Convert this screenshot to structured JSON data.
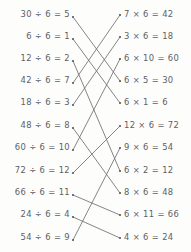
{
  "worksheet": {
    "type": "matching-worksheet",
    "topic": "division and multiplication facts of 6",
    "background_color": "#fdfdfc",
    "ink_color": "#4a4a4e",
    "line_color": "#6f6f73"
  },
  "left_column": {
    "name": "division-facts",
    "items": [
      {
        "id": "L1",
        "text": "30 ÷ 6 = 5",
        "dividend": 30,
        "divisor": 6,
        "quotient": 5,
        "y": 14
      },
      {
        "id": "L2",
        "text": "6 ÷ 6 = 1",
        "dividend": 6,
        "divisor": 6,
        "quotient": 1,
        "y": 36
      },
      {
        "id": "L3",
        "text": "12 ÷ 6 = 2",
        "dividend": 12,
        "divisor": 6,
        "quotient": 2,
        "y": 58
      },
      {
        "id": "L4",
        "text": "42 ÷ 6 = 7",
        "dividend": 42,
        "divisor": 6,
        "quotient": 7,
        "y": 80
      },
      {
        "id": "L5",
        "text": "18 ÷ 6 = 3",
        "dividend": 18,
        "divisor": 6,
        "quotient": 3,
        "y": 102
      },
      {
        "id": "L6",
        "text": "48 ÷ 6 = 8",
        "dividend": 48,
        "divisor": 6,
        "quotient": 8,
        "y": 125
      },
      {
        "id": "L7",
        "text": "60 ÷ 6 = 10",
        "dividend": 60,
        "divisor": 6,
        "quotient": 10,
        "y": 147
      },
      {
        "id": "L8",
        "text": "72 ÷ 6 = 12",
        "dividend": 72,
        "divisor": 6,
        "quotient": 12,
        "y": 170
      },
      {
        "id": "L9",
        "text": "66 ÷ 6 = 11",
        "dividend": 66,
        "divisor": 6,
        "quotient": 11,
        "y": 192
      },
      {
        "id": "L10",
        "text": "24 ÷ 6 = 4",
        "dividend": 24,
        "divisor": 6,
        "quotient": 4,
        "y": 214
      },
      {
        "id": "L11",
        "text": "54 ÷ 6 = 9",
        "dividend": 54,
        "divisor": 6,
        "quotient": 9,
        "y": 237
      }
    ]
  },
  "right_column": {
    "name": "multiplication-facts",
    "items": [
      {
        "id": "R1",
        "text": "7 × 6 = 42",
        "factor_a": 7,
        "factor_b": 6,
        "product": 42,
        "y": 14
      },
      {
        "id": "R2",
        "text": "3 × 6 = 18",
        "factor_a": 3,
        "factor_b": 6,
        "product": 18,
        "y": 36
      },
      {
        "id": "R3",
        "text": "6 × 10 = 60",
        "factor_a": 6,
        "factor_b": 10,
        "product": 60,
        "y": 58
      },
      {
        "id": "R4",
        "text": "6 × 5 = 30",
        "factor_a": 6,
        "factor_b": 5,
        "product": 30,
        "y": 80
      },
      {
        "id": "R5",
        "text": "6 × 1 = 6",
        "factor_a": 6,
        "factor_b": 1,
        "product": 6,
        "y": 102
      },
      {
        "id": "R6",
        "text": "12 × 6 = 72",
        "factor_a": 12,
        "factor_b": 6,
        "product": 72,
        "y": 125
      },
      {
        "id": "R7",
        "text": "9 × 6 = 54",
        "factor_a": 9,
        "factor_b": 6,
        "product": 54,
        "y": 147
      },
      {
        "id": "R8",
        "text": "6 × 2 = 12",
        "factor_a": 6,
        "factor_b": 2,
        "product": 12,
        "y": 170
      },
      {
        "id": "R9",
        "text": "8 × 6 = 48",
        "factor_a": 8,
        "factor_b": 6,
        "product": 48,
        "y": 192
      },
      {
        "id": "R10",
        "text": "6 × 11 = 66",
        "factor_a": 6,
        "factor_b": 11,
        "product": 66,
        "y": 214
      },
      {
        "id": "R11",
        "text": "4 × 6 = 24",
        "factor_a": 4,
        "factor_b": 6,
        "product": 24,
        "y": 237
      }
    ]
  },
  "connections": [
    {
      "from": "L1",
      "to": "R4",
      "x1": 73,
      "y1": 17,
      "x2": 120,
      "y2": 81
    },
    {
      "from": "L2",
      "to": "R5",
      "x1": 73,
      "y1": 39,
      "x2": 120,
      "y2": 103
    },
    {
      "from": "L3",
      "to": "R8",
      "x1": 73,
      "y1": 61,
      "x2": 120,
      "y2": 171
    },
    {
      "from": "L4",
      "to": "R1",
      "x1": 73,
      "y1": 83,
      "x2": 120,
      "y2": 15
    },
    {
      "from": "L5",
      "to": "R2",
      "x1": 73,
      "y1": 105,
      "x2": 120,
      "y2": 37
    },
    {
      "from": "L6",
      "to": "R9",
      "x1": 73,
      "y1": 128,
      "x2": 120,
      "y2": 193
    },
    {
      "from": "L7",
      "to": "R3",
      "x1": 73,
      "y1": 150,
      "x2": 120,
      "y2": 59
    },
    {
      "from": "L8",
      "to": "R6",
      "x1": 73,
      "y1": 173,
      "x2": 120,
      "y2": 126
    },
    {
      "from": "L9",
      "to": "R10",
      "x1": 73,
      "y1": 195,
      "x2": 120,
      "y2": 215
    },
    {
      "from": "L10",
      "to": "R11",
      "x1": 73,
      "y1": 217,
      "x2": 120,
      "y2": 238
    },
    {
      "from": "L11",
      "to": "R7",
      "x1": 73,
      "y1": 240,
      "x2": 120,
      "y2": 148
    }
  ]
}
